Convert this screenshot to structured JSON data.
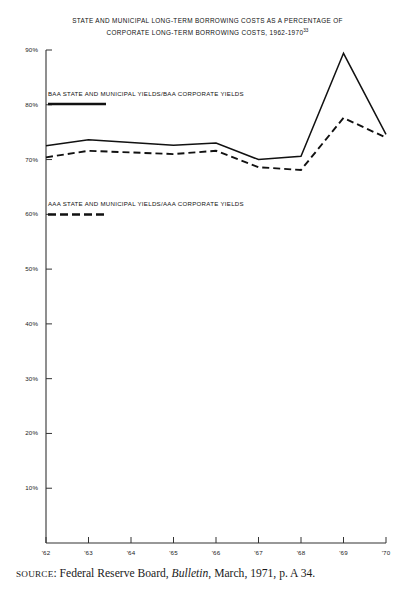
{
  "figure": {
    "title_line_1": "STATE AND MUNICIPAL  LONG-TERM BORROWING COSTS AS A PERCENTAGE OF",
    "title_line_2": "CORPORATE LONG-TERM BORROWING COSTS, 1962-1970",
    "title_footnote_marker": "33",
    "source_prefix": "SOURCE",
    "source_separator": ": Federal Reserve Board, ",
    "source_italic": "Bulletin",
    "source_suffix": ", March, 1971, p. A 34."
  },
  "legend": {
    "baa_label": "BAA STATE AND MUNICIPAL YIELDS/BAA CORPORATE YIELDS",
    "aaa_label": "AAA STATE AND MUNICIPAL YIELDS/AAA CORPORATE YIELDS"
  },
  "colors": {
    "line": "#111111",
    "axis": "#333333",
    "background": "#ffffff"
  },
  "chart_data": {
    "type": "line",
    "title": "STATE AND MUNICIPAL LONG-TERM BORROWING COSTS AS A PERCENTAGE OF CORPORATE LONG-TERM BORROWING COSTS, 1962-1970",
    "xlabel": "",
    "ylabel": "",
    "categories": [
      "'62",
      "'63",
      "'64",
      "'65",
      "'66",
      "'67",
      "'68",
      "'69",
      "'70"
    ],
    "x_tick_labels": [
      "'62",
      "'63",
      "'64",
      "'65",
      "'66",
      "'67",
      "'68",
      "'69",
      "'70"
    ],
    "y_tick_labels": [
      "90%",
      "80%",
      "70%",
      "60%",
      "50%",
      "40%",
      "30%",
      "20%",
      "10%"
    ],
    "y_tick_values": [
      90,
      80,
      70,
      60,
      50,
      40,
      30,
      20,
      10
    ],
    "ylim": [
      0,
      90
    ],
    "xlim": [
      "'62",
      "'70"
    ],
    "grid": false,
    "legend_position": "inside-upper-left",
    "series": [
      {
        "name": "BAA STATE AND MUNICIPAL YIELDS/BAA CORPORATE YIELDS",
        "style": "solid",
        "values": [
          72.5,
          73.6,
          73.1,
          72.6,
          73.0,
          70.0,
          70.6,
          89.4,
          74.6
        ]
      },
      {
        "name": "AAA STATE AND MUNICIPAL YIELDS/AAA CORPORATE YIELDS",
        "style": "dashed",
        "values": [
          70.4,
          71.6,
          71.3,
          71.0,
          71.6,
          68.6,
          68.1,
          77.6,
          74.0
        ]
      }
    ]
  }
}
